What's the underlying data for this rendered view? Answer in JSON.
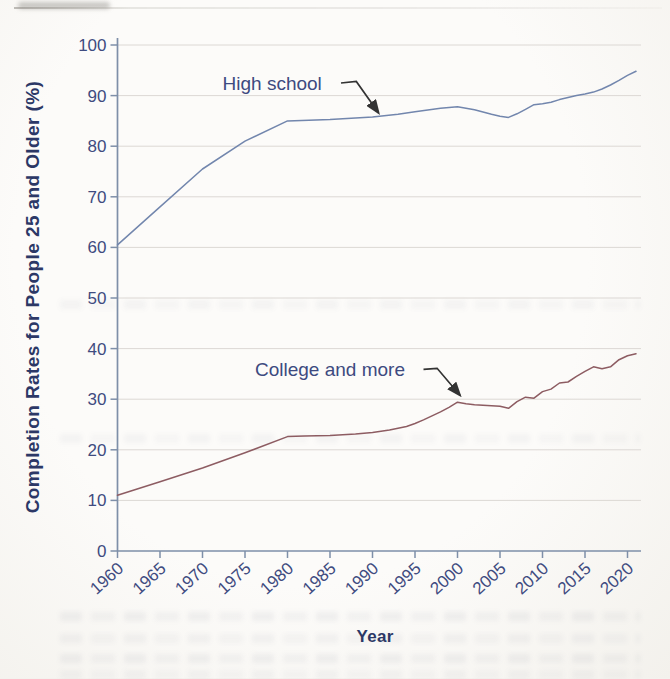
{
  "chart_data": {
    "type": "line",
    "title": "",
    "xlabel": "Year",
    "ylabel": "Completion Rates for People 25 and Older (%)",
    "xlim": [
      1960,
      2021
    ],
    "ylim": [
      0,
      100
    ],
    "x_ticks": [
      1960,
      1965,
      1970,
      1975,
      1980,
      1985,
      1990,
      1995,
      2000,
      2005,
      2010,
      2015,
      2020
    ],
    "y_ticks": [
      0,
      10,
      20,
      30,
      40,
      50,
      60,
      70,
      80,
      90,
      100
    ],
    "grid": "horizontal",
    "legend_position": "inline-annotations",
    "colors": {
      "high_school_line": "#7286ad",
      "college_line": "#8d5c62",
      "axis": "#7e8fa8",
      "gridline": "#dcd8d4",
      "tick_label": "#3f4b80",
      "axis_title": "#2c3866",
      "annotation_text": "#3d4a80",
      "arrow": "#333333"
    },
    "series": [
      {
        "name": "High school",
        "points": [
          [
            1960,
            60.5
          ],
          [
            1965,
            68.0
          ],
          [
            1970,
            75.5
          ],
          [
            1975,
            81.0
          ],
          [
            1980,
            85.0
          ],
          [
            1985,
            85.3
          ],
          [
            1990,
            85.8
          ],
          [
            1993,
            86.3
          ],
          [
            1995,
            86.8
          ],
          [
            1998,
            87.5
          ],
          [
            2000,
            87.8
          ],
          [
            2002,
            87.2
          ],
          [
            2004,
            86.3
          ],
          [
            2005,
            85.9
          ],
          [
            2006,
            85.7
          ],
          [
            2007,
            86.4
          ],
          [
            2008,
            87.3
          ],
          [
            2009,
            88.2
          ],
          [
            2010,
            88.4
          ],
          [
            2011,
            88.7
          ],
          [
            2012,
            89.2
          ],
          [
            2013,
            89.6
          ],
          [
            2014,
            90.0
          ],
          [
            2015,
            90.3
          ],
          [
            2016,
            90.7
          ],
          [
            2017,
            91.3
          ],
          [
            2018,
            92.1
          ],
          [
            2019,
            93.0
          ],
          [
            2020,
            94.0
          ],
          [
            2021,
            94.8
          ]
        ]
      },
      {
        "name": "College and more",
        "points": [
          [
            1960,
            11.0
          ],
          [
            1965,
            13.7
          ],
          [
            1970,
            16.4
          ],
          [
            1975,
            19.4
          ],
          [
            1980,
            22.6
          ],
          [
            1982,
            22.7
          ],
          [
            1985,
            22.8
          ],
          [
            1988,
            23.1
          ],
          [
            1990,
            23.4
          ],
          [
            1992,
            23.9
          ],
          [
            1994,
            24.6
          ],
          [
            1995,
            25.2
          ],
          [
            1996,
            25.9
          ],
          [
            1997,
            26.7
          ],
          [
            1998,
            27.5
          ],
          [
            1999,
            28.4
          ],
          [
            2000,
            29.4
          ],
          [
            2001,
            29.1
          ],
          [
            2002,
            28.9
          ],
          [
            2003,
            28.8
          ],
          [
            2004,
            28.7
          ],
          [
            2005,
            28.6
          ],
          [
            2006,
            28.2
          ],
          [
            2007,
            29.5
          ],
          [
            2008,
            30.4
          ],
          [
            2009,
            30.2
          ],
          [
            2010,
            31.5
          ],
          [
            2011,
            32.0
          ],
          [
            2012,
            33.2
          ],
          [
            2013,
            33.4
          ],
          [
            2014,
            34.5
          ],
          [
            2015,
            35.5
          ],
          [
            2016,
            36.4
          ],
          [
            2017,
            36.0
          ],
          [
            2018,
            36.4
          ],
          [
            2019,
            37.8
          ],
          [
            2020,
            38.6
          ],
          [
            2021,
            39.0
          ]
        ]
      }
    ],
    "annotations": [
      {
        "text": "High school",
        "series_index": 0,
        "label_at": [
          1978.2,
          92.3
        ],
        "arrow_path": [
          [
            1986.3,
            92.5
          ],
          [
            1988.1,
            92.8
          ],
          [
            1990.7,
            86.6
          ]
        ]
      },
      {
        "text": "College and more",
        "series_index": 1,
        "label_at": [
          1985.0,
          35.8
        ],
        "arrow_path": [
          [
            1996.0,
            35.9
          ],
          [
            1997.6,
            36.1
          ],
          [
            2000.3,
            30.8
          ]
        ]
      }
    ]
  }
}
